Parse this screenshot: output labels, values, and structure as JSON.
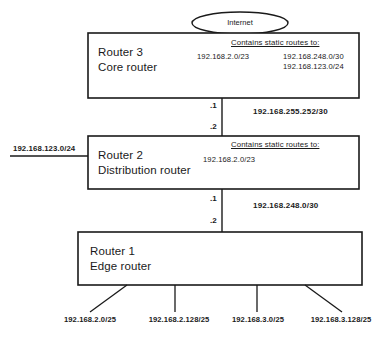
{
  "diagram": {
    "colors": {
      "stroke": "#1a1a1a",
      "background": "#ffffff",
      "text": "#1a1a1a"
    },
    "cloud": {
      "label": "Internet"
    },
    "routers": [
      {
        "id": "router3",
        "name": "Router 3",
        "role": "Core router",
        "static_heading": "Contains static routes to:",
        "connected_network": "192.168.2.0/23",
        "static_routes": [
          "192.168.248.0/30",
          "192.168.123.0/24"
        ]
      },
      {
        "id": "router2",
        "name": "Router 2",
        "role": "Distribution router",
        "static_heading": "Contains static routes to:",
        "connected_network": "192.168.2.0/23",
        "static_routes": []
      },
      {
        "id": "router1",
        "name": "Router 1",
        "role": "Edge router",
        "static_heading": "",
        "connected_network": "",
        "static_routes": []
      }
    ],
    "links": [
      {
        "id": "link-core-distribution",
        "network": "192.168.255.252/30",
        "upper_interface": ".1",
        "lower_interface": ".2"
      },
      {
        "id": "link-distribution-edge",
        "network": "192.168.248.0/30",
        "upper_interface": ".1",
        "lower_interface": ".2"
      }
    ],
    "side_network": {
      "label": "192.168.123.0/24"
    },
    "edge_networks": [
      "192.168.2.0/25",
      "192.168.2.128/25",
      "192.168.3.0/25",
      "192.168.3.128/25"
    ]
  }
}
